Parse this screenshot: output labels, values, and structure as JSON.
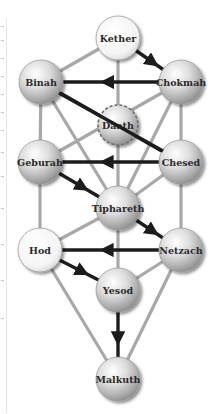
{
  "diagram": {
    "colors": {
      "background": "#ffffff",
      "path_gray": "#a8a8a8",
      "flash_black": "#1c1c1c",
      "sphere_light": "#fbfbfb",
      "sphere_mid": "#cfcfcf",
      "sphere_dark": "#8e8e8e",
      "label": "#2a2a2a"
    },
    "nodes": [
      {
        "id": "kether",
        "label": "Kether",
        "x": 118,
        "y": 38,
        "r": 22,
        "tone": "white"
      },
      {
        "id": "chokmah",
        "label": "Chokmah",
        "x": 181,
        "y": 82,
        "r": 22,
        "tone": "gray"
      },
      {
        "id": "binah",
        "label": "Binah",
        "x": 41,
        "y": 82,
        "r": 22,
        "tone": "gray"
      },
      {
        "id": "daath",
        "label": "Daath",
        "x": 118,
        "y": 125,
        "r": 20,
        "tone": "gray",
        "dashed": true
      },
      {
        "id": "chesed",
        "label": "Chesed",
        "x": 181,
        "y": 162,
        "r": 22,
        "tone": "gray"
      },
      {
        "id": "geburah",
        "label": "Geburah",
        "x": 40,
        "y": 162,
        "r": 22,
        "tone": "gray"
      },
      {
        "id": "tiphareth",
        "label": "Tiphareth",
        "x": 118,
        "y": 208,
        "r": 22,
        "tone": "gray"
      },
      {
        "id": "netzach",
        "label": "Netzach",
        "x": 181,
        "y": 250,
        "r": 22,
        "tone": "gray"
      },
      {
        "id": "hod",
        "label": "Hod",
        "x": 40,
        "y": 250,
        "r": 22,
        "tone": "white"
      },
      {
        "id": "yesod",
        "label": "Yesod",
        "x": 118,
        "y": 290,
        "r": 22,
        "tone": "gray"
      },
      {
        "id": "malkuth",
        "label": "Malkuth",
        "x": 118,
        "y": 379,
        "r": 22,
        "tone": "gray"
      }
    ],
    "gray_paths": [
      [
        "kether",
        "binah"
      ],
      [
        "kether",
        "tiphareth"
      ],
      [
        "chokmah",
        "chesed"
      ],
      [
        "chokmah",
        "tiphareth"
      ],
      [
        "chokmah",
        "geburah"
      ],
      [
        "binah",
        "geburah"
      ],
      [
        "binah",
        "tiphareth"
      ],
      [
        "chesed",
        "tiphareth"
      ],
      [
        "chesed",
        "netzach"
      ],
      [
        "geburah",
        "hod"
      ],
      [
        "tiphareth",
        "hod"
      ],
      [
        "tiphareth",
        "yesod"
      ],
      [
        "netzach",
        "yesod"
      ],
      [
        "netzach",
        "malkuth"
      ],
      [
        "hod",
        "malkuth"
      ]
    ],
    "flash_paths": [
      [
        "kether",
        "chokmah"
      ],
      [
        "chokmah",
        "binah"
      ],
      [
        "binah",
        "chesed"
      ],
      [
        "chesed",
        "geburah"
      ],
      [
        "geburah",
        "tiphareth"
      ],
      [
        "tiphareth",
        "netzach"
      ],
      [
        "netzach",
        "hod"
      ],
      [
        "hod",
        "yesod"
      ],
      [
        "yesod",
        "malkuth"
      ]
    ]
  }
}
